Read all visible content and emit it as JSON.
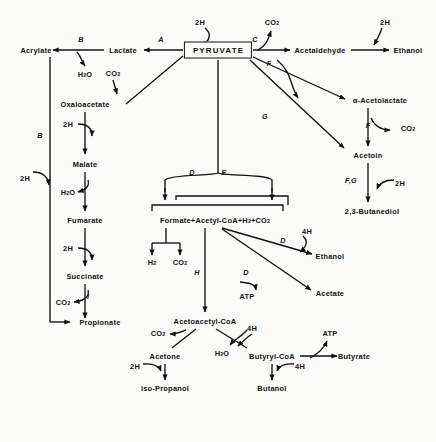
{
  "diagram": {
    "type": "metabolic-pathway",
    "canvas": {
      "width": 436,
      "height": 442
    },
    "colors": {
      "ink": "#111111",
      "background": "#fbfbfa"
    },
    "central_node": {
      "label": "PYRUVATE",
      "x": 218,
      "y": 50
    },
    "nodes": [
      {
        "id": "acrylate",
        "label": "Acrylate",
        "x": 36,
        "y": 50
      },
      {
        "id": "lactate",
        "label": "Lactate",
        "x": 123,
        "y": 50
      },
      {
        "id": "acetaldehyde",
        "label": "Acetaldehyde",
        "x": 320,
        "y": 50
      },
      {
        "id": "ethanol_top",
        "label": "Ethanol",
        "x": 408,
        "y": 50
      },
      {
        "id": "h2o_top",
        "label": "H<sub>2</sub>O",
        "x": 85,
        "y": 74
      },
      {
        "id": "co2_oaa",
        "label": "CO<sub>2</sub>",
        "x": 113,
        "y": 73
      },
      {
        "id": "co2_top",
        "label": "CO<sub>2</sub>",
        "x": 272,
        "y": 22
      },
      {
        "id": "h2_top_left",
        "label": "2H",
        "x": 200,
        "y": 22
      },
      {
        "id": "h2_top_right",
        "label": "2H",
        "x": 385,
        "y": 22
      },
      {
        "id": "oxaloacetate",
        "label": "Oxaloacetate",
        "x": 85,
        "y": 104
      },
      {
        "id": "malate",
        "label": "Malate",
        "x": 85,
        "y": 164
      },
      {
        "id": "fumarate",
        "label": "Fumarate",
        "x": 85,
        "y": 220
      },
      {
        "id": "succinate",
        "label": "Succinate",
        "x": 85,
        "y": 276
      },
      {
        "id": "propionate",
        "label": "Propionate",
        "x": 100,
        "y": 322
      },
      {
        "id": "h2o_malate",
        "label": "H<sub>2</sub>O",
        "x": 68,
        "y": 192
      },
      {
        "id": "co2_succ",
        "label": "CO<sub>2</sub>",
        "x": 63,
        "y": 302
      },
      {
        "id": "h2_oaa",
        "label": "2H",
        "x": 68,
        "y": 124
      },
      {
        "id": "h2_fum",
        "label": "2H",
        "x": 68,
        "y": 248
      },
      {
        "id": "h2_acrylate",
        "label": "2H",
        "x": 25,
        "y": 178
      },
      {
        "id": "acetolactate",
        "label": "α-Acetolactate",
        "x": 380,
        "y": 100
      },
      {
        "id": "acetoin",
        "label": "Acetoin",
        "x": 368,
        "y": 155
      },
      {
        "id": "butanediol",
        "label": "2,3-Butanediol",
        "x": 372,
        "y": 211
      },
      {
        "id": "co2_acetolac",
        "label": "CO<sub>2</sub>",
        "x": 408,
        "y": 128
      },
      {
        "id": "h2_acetoin",
        "label": "2H",
        "x": 400,
        "y": 183
      },
      {
        "id": "formate_pool",
        "label": "Formate+Acetyl-CoA+H<sub>2</sub>+CO<sub>2</sub>",
        "x": 215,
        "y": 220
      },
      {
        "id": "h2_pool",
        "label": "H<sub>2</sub>",
        "x": 152,
        "y": 262
      },
      {
        "id": "co2_pool",
        "label": "CO<sub>2</sub>",
        "x": 180,
        "y": 262
      },
      {
        "id": "ethanol_mid",
        "label": "Ethanol",
        "x": 330,
        "y": 256
      },
      {
        "id": "acetate",
        "label": "Acetate",
        "x": 330,
        "y": 293
      },
      {
        "id": "atp_acetate",
        "label": "ATP",
        "x": 247,
        "y": 296
      },
      {
        "id": "h4_ethanol",
        "label": "4H",
        "x": 307,
        "y": 231
      },
      {
        "id": "acetoacetyl",
        "label": "Acetoacetyl-CoA",
        "x": 205,
        "y": 321
      },
      {
        "id": "co2_acetone",
        "label": "CO<sub>2</sub>",
        "x": 158,
        "y": 333
      },
      {
        "id": "acetone",
        "label": "Acetone",
        "x": 165,
        "y": 356
      },
      {
        "id": "isopropanol",
        "label": "iso-Propanol",
        "x": 165,
        "y": 388
      },
      {
        "id": "h2_isoprop",
        "label": "2H",
        "x": 135,
        "y": 366
      },
      {
        "id": "h2o_butyryl",
        "label": "H<sub>2</sub>O",
        "x": 222,
        "y": 353
      },
      {
        "id": "butyryl",
        "label": "Butyryl-CoA",
        "x": 272,
        "y": 356
      },
      {
        "id": "h4_butyryl",
        "label": "4H",
        "x": 252,
        "y": 328
      },
      {
        "id": "butyrate",
        "label": "Butyrate",
        "x": 354,
        "y": 356
      },
      {
        "id": "atp_butyrate",
        "label": "ATP",
        "x": 330,
        "y": 333
      },
      {
        "id": "butanol",
        "label": "Butanol",
        "x": 272,
        "y": 388
      },
      {
        "id": "h4_butanol",
        "label": "4H",
        "x": 300,
        "y": 366
      }
    ],
    "enzyme_labels": [
      {
        "id": "enz-A",
        "label": "A",
        "x": 161,
        "y": 39
      },
      {
        "id": "enz-B",
        "label": "B",
        "x": 81,
        "y": 39
      },
      {
        "id": "enz-B2",
        "label": "B",
        "x": 40,
        "y": 135
      },
      {
        "id": "enz-C",
        "label": "C",
        "x": 255,
        "y": 39
      },
      {
        "id": "enz-D",
        "label": "D",
        "x": 192,
        "y": 172
      },
      {
        "id": "enz-E",
        "label": "E",
        "x": 224,
        "y": 172
      },
      {
        "id": "enz-F",
        "label": "F",
        "x": 269,
        "y": 63
      },
      {
        "id": "enz-F2",
        "label": "F",
        "x": 368,
        "y": 125
      },
      {
        "id": "enz-FG",
        "label": "F,G",
        "x": 351,
        "y": 180
      },
      {
        "id": "enz-G",
        "label": "G",
        "x": 265,
        "y": 116
      },
      {
        "id": "enz-H",
        "label": "H",
        "x": 197,
        "y": 272
      },
      {
        "id": "enz-I",
        "label": "I",
        "x": 88,
        "y": 296
      },
      {
        "id": "enz-D2",
        "label": "D",
        "x": 283,
        "y": 240
      },
      {
        "id": "enz-D3",
        "label": "D",
        "x": 246,
        "y": 272
      }
    ]
  }
}
